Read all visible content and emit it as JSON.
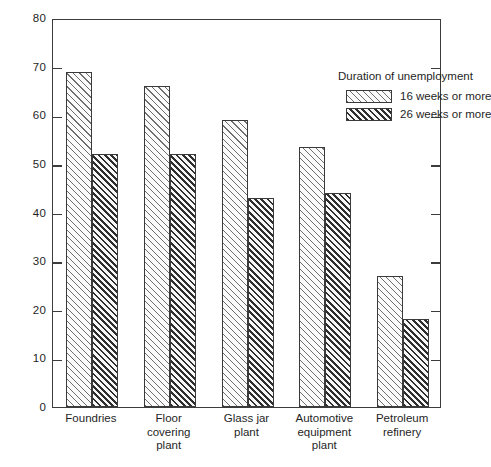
{
  "chart_data": {
    "type": "bar",
    "title": "",
    "xlabel": "",
    "ylabel": "",
    "ylim": [
      0,
      80
    ],
    "yticks": [
      0,
      10,
      20,
      30,
      40,
      50,
      60,
      70,
      80
    ],
    "ytick_labels": [
      "0",
      "10",
      "20",
      "30",
      "40",
      "50",
      "60",
      "70",
      "80"
    ],
    "grid": false,
    "legend_position": "top-right-inside",
    "legend_title": "Duration of unemployment",
    "categories": [
      "Foundries",
      "Floor covering plant",
      "Glass jar plant",
      "Automotive equipment plant",
      "Petroleum refinery"
    ],
    "category_label_lines": [
      [
        "Foundries"
      ],
      [
        "Floor",
        "covering",
        "plant"
      ],
      [
        "Glass jar",
        "plant"
      ],
      [
        "Automotive",
        "equipment",
        "plant"
      ],
      [
        "Petroleum",
        "refinery"
      ]
    ],
    "series": [
      {
        "name": "16 weeks or more",
        "pattern": "light-diagonal-hatch",
        "values": [
          69,
          66,
          59,
          53.5,
          27
        ]
      },
      {
        "name": "26 weeks or more",
        "pattern": "dark-diagonal-hatch",
        "values": [
          52,
          52,
          43,
          44,
          18
        ]
      }
    ]
  },
  "colors": {
    "frame": "#3c3c3c",
    "text": "#1f1f1f",
    "background": "#ffffff",
    "hatch_light": "#6e6e6e",
    "hatch_dark": "#2e2e2e"
  }
}
